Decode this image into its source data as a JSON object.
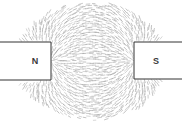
{
  "diagram": {
    "poles": [
      {
        "id": "north",
        "label": "N"
      },
      {
        "id": "south",
        "label": "S"
      }
    ],
    "field_pattern": "iron-filings",
    "colors": {
      "filings": "#9a9a9a",
      "magnet_outline": "#333333",
      "magnet_fill": "#ffffff",
      "label": "#3a3a3a"
    }
  }
}
